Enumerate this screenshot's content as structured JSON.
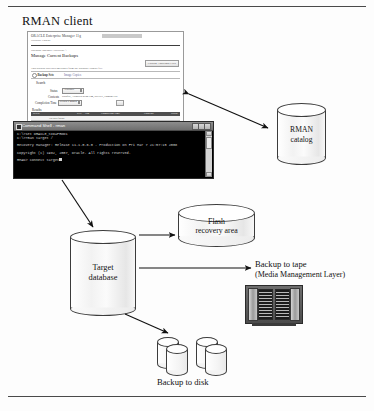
{
  "figure": {
    "title": "RMAN client"
  },
  "oem_window": {
    "brand": "ORACLE Enterprise Manager 11g",
    "brand_sub": "Database Control",
    "breadcrumb": "Database Instance: PRODB1 >",
    "heading": "Manage Current Backups",
    "catalog_button": "Catalog Additional Files",
    "note": "This backup also uses metadata from the database control file.",
    "backup_sets_label": "Backup Sets",
    "image_copies_label": "Image Copies",
    "search_section": "Search",
    "status_label": "Status",
    "status_value": "Available",
    "contents_label": "Contents",
    "contents_value": "Datafile, Archived Redo Log, SPFILE, Control File",
    "completion_label": "Completion Time",
    "completion_value": "Within a month",
    "go_button": "Go",
    "results_section": "Results",
    "table_headers": [
      "Select",
      "Key",
      "Tag",
      "Completion Time",
      "Contents",
      "Status"
    ],
    "empty_row": "No data found",
    "action_tabs": [
      "Select All",
      "Select None",
      "Crosscheck",
      "Delete",
      "Validate"
    ]
  },
  "command_shell": {
    "title": "Command Shell - rman",
    "lines": [
      "C:\\>set ORACLE_SID=PROD1",
      "C:\\>rman target /",
      "",
      "Recovery Manager: Release 11.1.0.6.0 - Production on Fri Mar 7 21:57:15 2008",
      "",
      "Copyright (c) 1982, 2007, Oracle.  All rights reserved.",
      "",
      "RMAN> connect target"
    ]
  },
  "nodes": {
    "rman_catalog": "RMAN\ncatalog",
    "rman_catalog_line1": "RMAN",
    "rman_catalog_line2": "catalog",
    "target_db_line1": "Target",
    "target_db_line2": "database",
    "flash_line1": "Flash",
    "flash_line2": "recovery area",
    "tape_line1": "Backup to tape",
    "tape_line2": "(Media Management Layer)",
    "disk_label": "Backup to disk"
  },
  "colors": {
    "ink": "#111111",
    "rule": "#4a4a4a",
    "shell_bg": "#000000",
    "shell_text": "#d2d2d2",
    "tape_body": "#4c4c4c"
  }
}
